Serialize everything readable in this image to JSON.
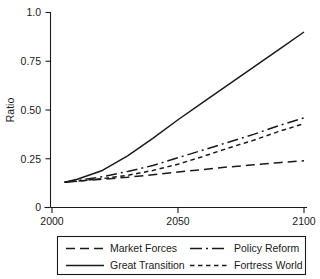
{
  "chart_data": {
    "type": "line",
    "title": "",
    "xlabel": "",
    "ylabel": "Ratio",
    "xlim": [
      2000,
      2100
    ],
    "ylim": [
      0,
      1.0
    ],
    "grid": false,
    "legend_position": "bottom",
    "x_ticks": [
      "2000",
      "2050",
      "2100"
    ],
    "x_tick_values": [
      2000,
      2050,
      2100
    ],
    "y_ticks": [
      "0",
      "0.25",
      "0.50",
      "0.75",
      "1.0"
    ],
    "y_tick_values": [
      0,
      0.25,
      0.5,
      0.75,
      1.0
    ],
    "x": [
      2005,
      2010,
      2020,
      2030,
      2040,
      2050,
      2060,
      2070,
      2080,
      2090,
      2100
    ],
    "series": [
      {
        "name": "Market Forces",
        "style": "long-dash",
        "dash": "9,5",
        "values": [
          0.13,
          0.135,
          0.145,
          0.155,
          0.168,
          0.182,
          0.195,
          0.208,
          0.219,
          0.23,
          0.24
        ]
      },
      {
        "name": "Great Transition",
        "style": "solid",
        "dash": "none",
        "values": [
          0.13,
          0.145,
          0.19,
          0.265,
          0.355,
          0.45,
          0.54,
          0.63,
          0.72,
          0.81,
          0.9
        ]
      },
      {
        "name": "Policy Reform",
        "style": "dash-dot",
        "dash": "11,4,2,4",
        "values": [
          0.13,
          0.138,
          0.158,
          0.185,
          0.215,
          0.255,
          0.295,
          0.335,
          0.375,
          0.42,
          0.46
        ]
      },
      {
        "name": "Fortress World",
        "style": "short-dash",
        "dash": "4.5,3.5",
        "values": [
          0.13,
          0.135,
          0.148,
          0.165,
          0.19,
          0.222,
          0.262,
          0.305,
          0.345,
          0.39,
          0.43
        ]
      }
    ]
  },
  "legend": {
    "entries": [
      {
        "label": "Market Forces",
        "style": "long-dash"
      },
      {
        "label": "Policy Reform",
        "style": "dash-dot"
      },
      {
        "label": "Great Transition",
        "style": "solid"
      },
      {
        "label": "Fortress World",
        "style": "short-dash"
      }
    ]
  },
  "colors": {
    "ink": "#1a1a1a",
    "background": "#ffffff"
  }
}
